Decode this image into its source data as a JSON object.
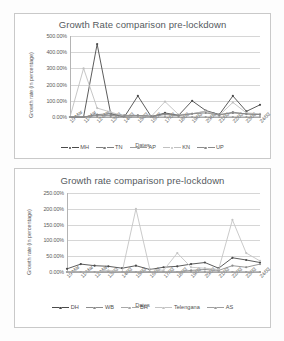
{
  "document": {
    "background_color": "#fdfdfd",
    "border_color": "#c9c9c9"
  },
  "charts": [
    {
      "id": "chart1",
      "title": "Growth Rate comparison pre-lockdown",
      "xlabel": "Dates",
      "ylabel": "Growth rate (in percentage)",
      "yticks": [
        "0.00%",
        "100.00%",
        "200.00%",
        "300.00%",
        "400.00%",
        "500.00%"
      ],
      "legend": [
        "MH",
        "TN",
        "AP",
        "KN",
        "UP"
      ]
    },
    {
      "id": "chart2",
      "title": "Growth rate comparison pre-lockdown",
      "xlabel": "Dates",
      "ylabel": "Growth rate (in percentage)",
      "yticks": [
        "0.00%",
        "50.00%",
        "100.00%",
        "150.00%",
        "200.00%",
        "250.00%"
      ],
      "legend": [
        "DH",
        "WB",
        "BH",
        "Telengana",
        "AS"
      ]
    }
  ],
  "chart_data": [
    {
      "type": "line",
      "title": "Growth Rate comparison pre-lockdown",
      "xlabel": "Dates",
      "ylabel": "Growth rate (in percentage)",
      "ylim": [
        0,
        500
      ],
      "ytick_values": [
        0,
        100,
        200,
        300,
        400,
        500
      ],
      "ytick_labels": [
        "0.00%",
        "100.00%",
        "200.00%",
        "300.00%",
        "400.00%",
        "500.00%"
      ],
      "grid": true,
      "legend_position": "bottom",
      "categories": [
        "10-Mar",
        "11-Mar",
        "12-Mar",
        "13/03",
        "14/03",
        "15/03",
        "16/03",
        "17/03",
        "18/03",
        "19/03",
        "20/03",
        "21/03",
        "22/03",
        "23/03",
        "24/03"
      ],
      "series": [
        {
          "name": "MH",
          "color": "#4a4a4a",
          "values": [
            0,
            0,
            450,
            20,
            0,
            130,
            0,
            25,
            10,
            100,
            40,
            15,
            130,
            35,
            75
          ]
        },
        {
          "name": "TN",
          "color": "#7d7d7d",
          "values": [
            0,
            0,
            15,
            20,
            10,
            10,
            5,
            20,
            10,
            20,
            35,
            15,
            25,
            20,
            15
          ]
        },
        {
          "name": "AP",
          "color": "#9a9a9a",
          "values": [
            0,
            0,
            0,
            0,
            0,
            0,
            0,
            0,
            0,
            0,
            0,
            0,
            0,
            0,
            0
          ]
        },
        {
          "name": "KN",
          "color": "#c0c0c0",
          "values": [
            0,
            300,
            55,
            30,
            5,
            5,
            5,
            95,
            15,
            20,
            35,
            10,
            90,
            25,
            20
          ]
        },
        {
          "name": "UP",
          "color": "#8a8a8a",
          "values": [
            0,
            0,
            10,
            10,
            5,
            8,
            5,
            15,
            10,
            20,
            25,
            12,
            30,
            18,
            15
          ]
        }
      ]
    },
    {
      "type": "line",
      "title": "Growth rate comparison pre-lockdown",
      "xlabel": "Dates",
      "ylabel": "Growth rate (in percentage)",
      "ylim": [
        0,
        250
      ],
      "ytick_values": [
        0,
        50,
        100,
        150,
        200,
        250
      ],
      "ytick_labels": [
        "0.00%",
        "50.00%",
        "100.00%",
        "150.00%",
        "200.00%",
        "250.00%"
      ],
      "grid": true,
      "legend_position": "bottom",
      "categories": [
        "10-Mar",
        "11-Mar",
        "12-Mar",
        "13/03",
        "14/03",
        "15/03",
        "16/03",
        "17/03",
        "18/03",
        "19/03",
        "20/03",
        "21/03",
        "22/03",
        "23/03",
        "24/03"
      ],
      "series": [
        {
          "name": "DH",
          "color": "#4a4a4a",
          "values": [
            10,
            25,
            20,
            18,
            12,
            20,
            8,
            15,
            18,
            25,
            30,
            12,
            45,
            38,
            30
          ]
        },
        {
          "name": "WB",
          "color": "#8c8c8c",
          "values": [
            0,
            0,
            0,
            0,
            0,
            0,
            0,
            0,
            0,
            5,
            8,
            5,
            20,
            15,
            25
          ]
        },
        {
          "name": "BH",
          "color": "#a8a8a8",
          "values": [
            0,
            0,
            0,
            0,
            0,
            0,
            0,
            0,
            0,
            0,
            0,
            0,
            0,
            0,
            0
          ]
        },
        {
          "name": "Telengana",
          "color": "#c4c4c4",
          "values": [
            0,
            0,
            0,
            5,
            0,
            200,
            10,
            5,
            60,
            15,
            12,
            8,
            165,
            60,
            35
          ]
        },
        {
          "name": "AS",
          "color": "#9e9e9e",
          "values": [
            0,
            0,
            0,
            0,
            0,
            0,
            0,
            0,
            0,
            0,
            0,
            0,
            0,
            0,
            0
          ]
        }
      ]
    }
  ]
}
